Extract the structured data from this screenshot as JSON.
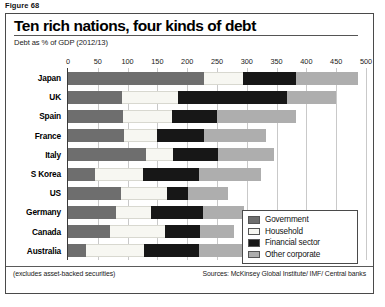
{
  "figure": {
    "caption": "Figure 68"
  },
  "header": {
    "title": "Ten rich nations, four kinds of debt",
    "subtitle": "Debt as % of GDP (2012/13)"
  },
  "footer": {
    "note": "(excludes asset-backed securities)",
    "sources": "Sources: McKinsey Global Institute/ IMF/ Central banks"
  },
  "legend": {
    "items": [
      {
        "label": "Government",
        "color": "#6e6e6e",
        "key": "government"
      },
      {
        "label": "Household",
        "color": "#f7f7f2",
        "key": "household"
      },
      {
        "label": "Financial sector",
        "color": "#171717",
        "key": "financial"
      },
      {
        "label": "Other corporate",
        "color": "#aeaeae",
        "key": "corporate"
      }
    ]
  },
  "chart_data": {
    "type": "bar",
    "orientation": "horizontal",
    "stacked": true,
    "title": "Ten rich nations, four kinds of debt",
    "subtitle": "Debt as % of GDP (2012/13)",
    "xlabel": "Debt as % of GDP",
    "ylabel": "",
    "xlim": [
      0,
      500
    ],
    "xticks": [
      0,
      50,
      100,
      150,
      200,
      250,
      300,
      350,
      400,
      450,
      500
    ],
    "xtick_labels": [
      "0",
      "50",
      "100",
      "150",
      "200",
      "250",
      "300",
      "350",
      "400",
      "450",
      "500"
    ],
    "grid": true,
    "grid_axis": "x",
    "legend_position": "inside-bottom-right",
    "categories": [
      "Japan",
      "UK",
      "Spain",
      "France",
      "Italy",
      "S Korea",
      "US",
      "Germany",
      "Canada",
      "Australia"
    ],
    "series": [
      {
        "name": "Government",
        "color": "#6e6e6e",
        "values": [
          228,
          90,
          92,
          94,
          131,
          45,
          89,
          81,
          70,
          31
        ]
      },
      {
        "name": "Household",
        "color": "#f7f7f2",
        "values": [
          65,
          95,
          82,
          56,
          45,
          81,
          77,
          58,
          92,
          97
        ]
      },
      {
        "name": "Financial sector",
        "color": "#171717",
        "values": [
          89,
          182,
          76,
          78,
          76,
          93,
          36,
          88,
          60,
          91
        ]
      },
      {
        "name": "Other corporate",
        "color": "#aeaeae",
        "values": [
          105,
          83,
          132,
          104,
          94,
          105,
          67,
          68,
          57,
          79
        ]
      }
    ],
    "totals": [
      487,
      450,
      382,
      332,
      346,
      324,
      269,
      295,
      279,
      298
    ],
    "units": "% of GDP"
  }
}
